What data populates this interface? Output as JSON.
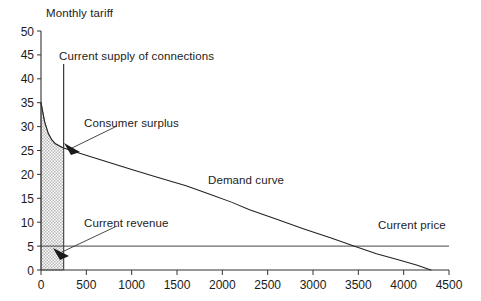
{
  "chart_data": {
    "type": "line",
    "title": "",
    "ylabel": "Monthly tariff",
    "xlabel": "",
    "xlim": [
      0,
      4500
    ],
    "ylim": [
      0,
      50
    ],
    "grid": false,
    "legend": "none",
    "xticks": [
      0,
      500,
      1000,
      1500,
      2000,
      2500,
      3000,
      3500,
      4000,
      4500
    ],
    "yticks": [
      0,
      5,
      10,
      15,
      20,
      25,
      30,
      35,
      40,
      45,
      50
    ],
    "series": [
      {
        "name": "Demand curve",
        "type": "line",
        "points": [
          [
            0,
            35.0
          ],
          [
            40,
            31.0
          ],
          [
            80,
            28.6
          ],
          [
            120,
            27.2
          ],
          [
            160,
            26.4
          ],
          [
            220,
            25.8
          ],
          [
            250,
            25.5
          ],
          [
            400,
            24.6
          ],
          [
            700,
            22.8
          ],
          [
            1000,
            21.0
          ],
          [
            1300,
            19.3
          ],
          [
            1600,
            17.6
          ],
          [
            1900,
            15.6
          ],
          [
            2100,
            14.2
          ],
          [
            2300,
            12.6
          ],
          [
            2600,
            10.6
          ],
          [
            2900,
            8.6
          ],
          [
            3200,
            6.7
          ],
          [
            3450,
            5.0
          ],
          [
            3700,
            3.4
          ],
          [
            3950,
            2.1
          ],
          [
            4150,
            1.0
          ],
          [
            4300,
            0.0
          ]
        ]
      },
      {
        "name": "Current price",
        "type": "hline",
        "value": 5.0
      },
      {
        "name": "Current supply of connections",
        "type": "vline",
        "value": 250
      },
      {
        "name": "Consumer surplus",
        "type": "shaded-region",
        "x_range": [
          0,
          250
        ],
        "y_range": [
          0,
          "demand"
        ]
      }
    ],
    "annotations": [
      {
        "id": "monthly-tariff",
        "text": "Monthly tariff",
        "x_px": 46,
        "y_px": 8
      },
      {
        "id": "current-supply",
        "text": "Current supply of connections",
        "x_px": 59,
        "y_px": 50
      },
      {
        "id": "consumer-surplus",
        "text": "Consumer surplus",
        "x_px": 84,
        "y_px": 117
      },
      {
        "id": "current-revenue",
        "text": "Current revenue",
        "x_px": 84,
        "y_px": 217
      },
      {
        "id": "demand-curve",
        "text": "Demand curve",
        "x_px": 208,
        "y_px": 174
      },
      {
        "id": "current-price",
        "text": "Current price",
        "x_px": 378,
        "y_px": 219
      }
    ]
  }
}
